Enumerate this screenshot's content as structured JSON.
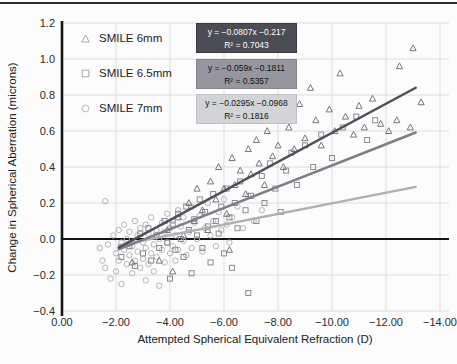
{
  "page": {
    "background": "#fcfcfc",
    "top_rule_color": "#2a2a2a"
  },
  "chart_data": {
    "type": "scatter",
    "title": "",
    "xlabel": "Attempted Spherical Equivalent Refraction (D)",
    "ylabel": "Change in Spherical Aberration (microns)",
    "xlim": [
      0,
      -14.35
    ],
    "ylim": [
      -0.4,
      1.2
    ],
    "grid": true,
    "grid_color": "#dcdcdc",
    "zero_line_color": "#151515",
    "axis_color": "#151515",
    "tick_label_color": "#2b2b2b",
    "legend_position": "upper-left-inside",
    "x_ticks": {
      "values": [
        0,
        -2,
        -4,
        -6,
        -8,
        -10,
        -12,
        -14
      ],
      "labels": [
        "0.00",
        "−2.00",
        "−4.00",
        "−6.00",
        "−8.00",
        "−10.00",
        "−12.00",
        "−14.00"
      ]
    },
    "y_ticks": {
      "values": [
        -0.4,
        -0.2,
        0.0,
        0.2,
        0.4,
        0.6,
        0.8,
        1.0,
        1.2
      ],
      "labels": [
        "−0.4",
        "−0.2",
        "0.0",
        "0.2",
        "0.4",
        "0.6",
        "0.8",
        "1.0",
        "1.2"
      ]
    },
    "series": [
      {
        "name": "SMILE 6mm",
        "marker": "triangle",
        "marker_color": "#77787d",
        "line_color": "#4e4f58",
        "legend_marker_color": "#a8a9ad",
        "equation": "y = −0.0807x −0.217",
        "r2": "R² = 0.7043",
        "eq_box_bg": "#4b4c54",
        "trend": {
          "slope": -0.0807,
          "intercept": -0.217,
          "x_start": -2.1,
          "x_end": -13.1
        },
        "points": [
          [
            -2.6,
            -0.13
          ],
          [
            -3.6,
            -0.12
          ],
          [
            -3.9,
            0.05
          ],
          [
            -4.1,
            -0.18
          ],
          [
            -4.3,
            0.12
          ],
          [
            -4.5,
            0.02
          ],
          [
            -4.7,
            0.2
          ],
          [
            -4.9,
            0.1
          ],
          [
            -5.0,
            0.28
          ],
          [
            -5.2,
            0.16
          ],
          [
            -5.4,
            0.05
          ],
          [
            -5.5,
            0.32
          ],
          [
            -5.7,
            0.22
          ],
          [
            -5.8,
            0.4
          ],
          [
            -6.0,
            0.28
          ],
          [
            -6.1,
            0.14
          ],
          [
            -6.2,
            -0.06
          ],
          [
            -6.3,
            0.45
          ],
          [
            -6.4,
            0.3
          ],
          [
            -6.6,
            0.38
          ],
          [
            -6.8,
            0.25
          ],
          [
            -6.9,
            0.5
          ],
          [
            -7.0,
            0.36
          ],
          [
            -7.2,
            0.55
          ],
          [
            -7.3,
            0.42
          ],
          [
            -7.5,
            0.3
          ],
          [
            -7.6,
            0.6
          ],
          [
            -7.8,
            0.46
          ],
          [
            -7.9,
            0.7
          ],
          [
            -8.0,
            0.52
          ],
          [
            -8.2,
            0.4
          ],
          [
            -8.4,
            0.62
          ],
          [
            -8.6,
            0.5
          ],
          [
            -8.8,
            0.75
          ],
          [
            -9.0,
            0.56
          ],
          [
            -9.2,
            0.84
          ],
          [
            -9.4,
            0.66
          ],
          [
            -9.6,
            0.52
          ],
          [
            -9.9,
            0.72
          ],
          [
            -10.1,
            0.6
          ],
          [
            -10.3,
            0.92
          ],
          [
            -10.5,
            0.68
          ],
          [
            -10.8,
            0.58
          ],
          [
            -11.0,
            0.74
          ],
          [
            -11.2,
            0.62
          ],
          [
            -11.5,
            0.78
          ],
          [
            -11.8,
            0.64
          ],
          [
            -12.1,
            0.6
          ],
          [
            -12.4,
            0.66
          ],
          [
            -12.5,
            0.96
          ],
          [
            -12.9,
            0.62
          ],
          [
            -13.0,
            1.06
          ],
          [
            -13.3,
            0.76
          ]
        ]
      },
      {
        "name": "SMILE 6.5mm",
        "marker": "square",
        "marker_color": "#8b8c91",
        "line_color": "#7d7e88",
        "legend_marker_color": "#a8a9ad",
        "equation": "y = −0.059x −0.1811",
        "r2": "R² = 0.5357",
        "eq_box_bg": "#95969e",
        "trend": {
          "slope": -0.059,
          "intercept": -0.1811,
          "x_start": -2.1,
          "x_end": -13.1
        },
        "points": [
          [
            -2.2,
            -0.1
          ],
          [
            -2.5,
            -0.04
          ],
          [
            -2.7,
            -0.15
          ],
          [
            -2.9,
            0.03
          ],
          [
            -3.0,
            -0.08
          ],
          [
            -3.2,
            0.06
          ],
          [
            -3.3,
            -0.12
          ],
          [
            -3.5,
            0.02
          ],
          [
            -3.6,
            -0.05
          ],
          [
            -3.8,
            0.1
          ],
          [
            -3.9,
            -0.02
          ],
          [
            -4.0,
            -0.22
          ],
          [
            -4.1,
            0.08
          ],
          [
            -4.2,
            -0.06
          ],
          [
            -4.3,
            0.14
          ],
          [
            -4.4,
            0.0
          ],
          [
            -4.5,
            -0.1
          ],
          [
            -4.6,
            0.18
          ],
          [
            -4.7,
            0.05
          ],
          [
            -4.8,
            -0.19
          ],
          [
            -4.9,
            0.11
          ],
          [
            -5.0,
            0.02
          ],
          [
            -5.1,
            0.22
          ],
          [
            -5.2,
            -0.05
          ],
          [
            -5.3,
            0.15
          ],
          [
            -5.4,
            0.07
          ],
          [
            -5.5,
            -0.13
          ],
          [
            -5.6,
            0.25
          ],
          [
            -5.7,
            0.1
          ],
          [
            -5.8,
            0.03
          ],
          [
            -5.9,
            0.18
          ],
          [
            -6.0,
            -0.08
          ],
          [
            -6.1,
            0.28
          ],
          [
            -6.2,
            0.12
          ],
          [
            -6.3,
            -0.16
          ],
          [
            -6.4,
            0.2
          ],
          [
            -6.5,
            0.06
          ],
          [
            -6.6,
            0.32
          ],
          [
            -6.8,
            0.16
          ],
          [
            -6.9,
            -0.3
          ],
          [
            -7.0,
            0.24
          ],
          [
            -7.2,
            0.1
          ],
          [
            -7.4,
            0.35
          ],
          [
            -7.5,
            0.2
          ],
          [
            -7.7,
            0.42
          ],
          [
            -7.9,
            0.28
          ],
          [
            -8.1,
            0.15
          ],
          [
            -8.3,
            0.38
          ],
          [
            -8.5,
            0.48
          ],
          [
            -8.7,
            0.3
          ],
          [
            -9.0,
            0.52
          ],
          [
            -9.3,
            0.4
          ],
          [
            -9.6,
            0.58
          ],
          [
            -10.0,
            0.45
          ],
          [
            -10.4,
            0.62
          ],
          [
            -10.9,
            0.68
          ],
          [
            -11.3,
            0.55
          ],
          [
            -11.6,
            0.66
          ]
        ]
      },
      {
        "name": "SMILE 7mm",
        "marker": "circle",
        "marker_color": "#b3b4b8",
        "line_color": "#aeb0b4",
        "legend_marker_color": "#b8b9bd",
        "equation": "y = −0.0295x −0.0968",
        "r2": "R² = 0.1816",
        "eq_box_bg": "#d3d4d7",
        "trend": {
          "slope": -0.0295,
          "intercept": -0.0968,
          "x_start": -2.1,
          "x_end": -13.1
        },
        "points": [
          [
            -1.4,
            -0.05
          ],
          [
            -1.5,
            -0.12
          ],
          [
            -1.6,
            0.21
          ],
          [
            -1.6,
            -0.16
          ],
          [
            -1.7,
            -0.03
          ],
          [
            -1.8,
            -0.22
          ],
          [
            -1.9,
            0.02
          ],
          [
            -2.0,
            -0.08
          ],
          [
            -2.0,
            -0.18
          ],
          [
            -2.1,
            0.05
          ],
          [
            -2.1,
            -0.12
          ],
          [
            -2.2,
            -0.02
          ],
          [
            -2.2,
            -0.25
          ],
          [
            -2.3,
            0.08
          ],
          [
            -2.3,
            -0.06
          ],
          [
            -2.4,
            -0.14
          ],
          [
            -2.4,
            0.0
          ],
          [
            -2.5,
            -0.09
          ],
          [
            -2.5,
            0.04
          ],
          [
            -2.6,
            -0.19
          ],
          [
            -2.6,
            -0.04
          ],
          [
            -2.7,
            0.1
          ],
          [
            -2.7,
            -0.12
          ],
          [
            -2.8,
            0.02
          ],
          [
            -2.8,
            -0.07
          ],
          [
            -2.9,
            -0.16
          ],
          [
            -2.9,
            0.06
          ],
          [
            -3.0,
            -0.02
          ],
          [
            -3.0,
            -0.11
          ],
          [
            -3.1,
            0.08
          ],
          [
            -3.1,
            -0.05
          ],
          [
            -3.1,
            -0.23
          ],
          [
            -3.2,
            -0.14
          ],
          [
            -3.2,
            0.03
          ],
          [
            -3.3,
            -0.08
          ],
          [
            -3.3,
            0.12
          ],
          [
            -3.4,
            -0.03
          ],
          [
            -3.4,
            -0.18
          ],
          [
            -3.5,
            0.05
          ],
          [
            -3.5,
            -0.1
          ],
          [
            -3.6,
            0.0
          ],
          [
            -3.6,
            -0.26
          ],
          [
            -3.7,
            0.09
          ],
          [
            -3.7,
            -0.06
          ],
          [
            -3.8,
            -0.13
          ],
          [
            -3.8,
            0.04
          ],
          [
            -3.9,
            -0.02
          ],
          [
            -3.9,
            0.14
          ],
          [
            -4.0,
            -0.08
          ],
          [
            -4.0,
            0.06
          ],
          [
            -4.1,
            -0.04
          ],
          [
            -4.1,
            0.1
          ],
          [
            -4.2,
            -0.12
          ],
          [
            -4.2,
            0.02
          ],
          [
            -4.3,
            0.16
          ],
          [
            -4.3,
            -0.06
          ],
          [
            -4.4,
            0.07
          ],
          [
            -4.5,
            -0.01
          ],
          [
            -4.5,
            0.12
          ],
          [
            -4.6,
            -0.09
          ],
          [
            -4.7,
            0.04
          ],
          [
            -4.8,
            0.18
          ],
          [
            -4.8,
            -0.05
          ],
          [
            -4.9,
            0.09
          ],
          [
            -5.0,
            0.0
          ],
          [
            -5.1,
            0.13
          ],
          [
            -5.2,
            -0.07
          ],
          [
            -5.3,
            0.06
          ],
          [
            -5.4,
            0.2
          ],
          [
            -5.5,
            0.02
          ],
          [
            -5.6,
            0.1
          ],
          [
            -5.7,
            -0.04
          ],
          [
            -5.8,
            0.15
          ],
          [
            -5.9,
            0.05
          ],
          [
            -6.0,
            0.22
          ],
          [
            -6.1,
            0.08
          ],
          [
            -6.2,
            -0.02
          ],
          [
            -6.3,
            0.12
          ],
          [
            -6.5,
            0.18
          ],
          [
            -6.7,
            0.06
          ],
          [
            -6.9,
            0.24
          ],
          [
            -7.1,
            0.1
          ],
          [
            -7.4,
            0.16
          ]
        ]
      }
    ]
  }
}
